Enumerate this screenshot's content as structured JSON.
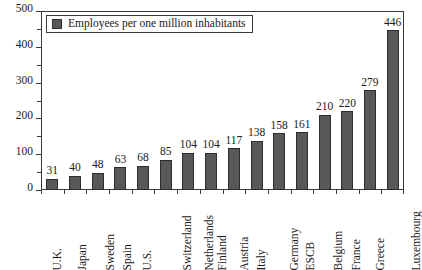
{
  "chart_data": {
    "type": "bar",
    "title": "",
    "subtitle": "",
    "xlabel": "",
    "ylabel": "",
    "ylim": [
      0,
      500
    ],
    "y_ticks_major": [
      0,
      100,
      200,
      300,
      400,
      500
    ],
    "y_ticks_minor": [
      50,
      150,
      250,
      350,
      450
    ],
    "grid": false,
    "legend_position": "top-left",
    "legend": [
      "Employees per one million inhabitants"
    ],
    "series_name": "Employees per one million inhabitants",
    "bar_color": "#585858",
    "bar_edge_color": "#2e2e2e",
    "categories": [
      "U.K.",
      "Japan",
      "Sweden",
      "Spain",
      "U.S.",
      "Switzerland",
      "Netherlands",
      "Finland",
      "Austria",
      "Italy",
      "Germany",
      "ESCB",
      "Belgium",
      "France",
      "Greece",
      "Luxembourg"
    ],
    "values": [
      31,
      40,
      48,
      63,
      68,
      85,
      104,
      104,
      117,
      138,
      158,
      161,
      210,
      220,
      279,
      446
    ],
    "data_labels": [
      "31",
      "40",
      "48",
      "63",
      "68",
      "85",
      "104",
      "104",
      "117",
      "138",
      "158",
      "161",
      "210",
      "220",
      "279",
      "446"
    ]
  },
  "legend": {
    "label": "Employees per one million inhabitants",
    "swatch_name": "legend-color-swatch"
  },
  "axes": {
    "y_tick_labels": [
      "0",
      "100",
      "200",
      "300",
      "400",
      "500"
    ]
  }
}
